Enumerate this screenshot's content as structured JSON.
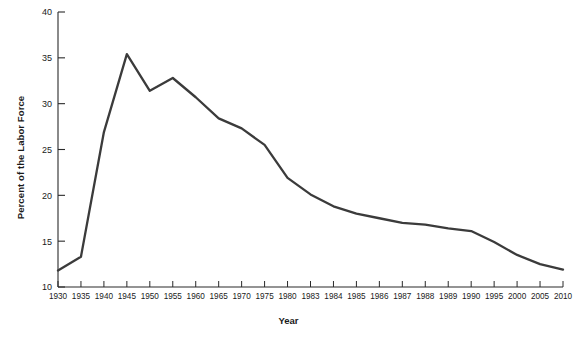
{
  "chart_data": {
    "type": "line",
    "title": "",
    "xlabel": "Year",
    "ylabel": "Percent of the Labor Force",
    "xlim": [
      1930,
      2010
    ],
    "ylim": [
      10,
      40
    ],
    "ytick_labels": [
      "10",
      "15",
      "20",
      "25",
      "30",
      "35",
      "40"
    ],
    "ytick_values": [
      10,
      15,
      20,
      25,
      30,
      35,
      40
    ],
    "grid": false,
    "legend": null,
    "line_color": "#3b3b3b",
    "categories": [
      "1930",
      "1935",
      "1940",
      "1945",
      "1950",
      "1955",
      "1960",
      "1965",
      "1970",
      "1975",
      "1980",
      "1983",
      "1984",
      "1985",
      "1986",
      "1987",
      "1988",
      "1989",
      "1990",
      "1995",
      "2000",
      "2005",
      "2010"
    ],
    "values": [
      11.8,
      13.3,
      26.9,
      35.4,
      31.4,
      32.8,
      30.7,
      28.4,
      27.3,
      25.5,
      21.9,
      20.1,
      18.8,
      18.0,
      17.5,
      17.0,
      16.8,
      16.4,
      16.1,
      14.9,
      13.5,
      12.5,
      11.9
    ],
    "x_positions_years": [
      1930,
      1935,
      1940,
      1945,
      1950,
      1955,
      1960,
      1965,
      1970,
      1975,
      1980,
      1983,
      1984,
      1985,
      1986,
      1987,
      1988,
      1989,
      1990,
      1995,
      2000,
      2005,
      2010
    ]
  },
  "axis": {
    "y_axis_title": "Percent of the Labor Force",
    "x_axis_title": "Year"
  }
}
